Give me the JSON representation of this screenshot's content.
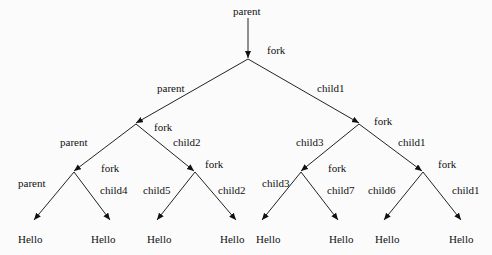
{
  "diagram": {
    "root_label": "parent",
    "edge_labels": [
      {
        "text": "fork",
        "x": 267,
        "y": 44
      },
      {
        "text": "parent",
        "x": 157,
        "y": 82
      },
      {
        "text": "child1",
        "x": 317,
        "y": 82
      },
      {
        "text": "fork",
        "x": 154,
        "y": 121
      },
      {
        "text": "fork",
        "x": 374,
        "y": 115
      },
      {
        "text": "parent",
        "x": 60,
        "y": 136
      },
      {
        "text": "child2",
        "x": 173,
        "y": 136
      },
      {
        "text": "child3",
        "x": 296,
        "y": 136
      },
      {
        "text": "child1",
        "x": 398,
        "y": 136
      },
      {
        "text": "fork",
        "x": 101,
        "y": 162
      },
      {
        "text": "fork",
        "x": 205,
        "y": 158
      },
      {
        "text": "fork",
        "x": 328,
        "y": 162
      },
      {
        "text": "fork",
        "x": 438,
        "y": 158
      },
      {
        "text": "parent",
        "x": 18,
        "y": 177
      },
      {
        "text": "child4",
        "x": 100,
        "y": 184
      },
      {
        "text": "child5",
        "x": 143,
        "y": 184
      },
      {
        "text": "child2",
        "x": 218,
        "y": 184
      },
      {
        "text": "child3",
        "x": 262,
        "y": 177
      },
      {
        "text": "child7",
        "x": 327,
        "y": 184
      },
      {
        "text": "child6",
        "x": 368,
        "y": 184
      },
      {
        "text": "child1",
        "x": 452,
        "y": 184
      }
    ],
    "leaves": [
      {
        "text": "Hello",
        "x": 18,
        "y": 233
      },
      {
        "text": "Hello",
        "x": 91,
        "y": 233
      },
      {
        "text": "Hello",
        "x": 147,
        "y": 233
      },
      {
        "text": "Hello",
        "x": 220,
        "y": 233
      },
      {
        "text": "Hello",
        "x": 256,
        "y": 233
      },
      {
        "text": "Hello",
        "x": 329,
        "y": 233
      },
      {
        "text": "Hello",
        "x": 375,
        "y": 233
      },
      {
        "text": "Hello",
        "x": 449,
        "y": 233
      }
    ]
  }
}
